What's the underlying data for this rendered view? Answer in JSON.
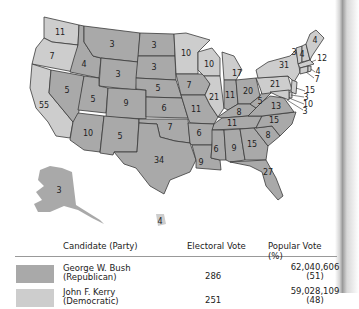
{
  "map": {
    "colors": {
      "republican": "#a9a9a9",
      "democrat": "#cdcdcd",
      "border": "#3a3a3a"
    },
    "states": [
      {
        "abbr": "WA",
        "ev": "11",
        "party": "democrat"
      },
      {
        "abbr": "OR",
        "ev": "7",
        "party": "democrat"
      },
      {
        "abbr": "CA",
        "ev": "55",
        "party": "democrat"
      },
      {
        "abbr": "ID",
        "ev": "4",
        "party": "republican"
      },
      {
        "abbr": "NV",
        "ev": "5",
        "party": "republican"
      },
      {
        "abbr": "MT",
        "ev": "3",
        "party": "republican"
      },
      {
        "abbr": "WY",
        "ev": "3",
        "party": "republican"
      },
      {
        "abbr": "UT",
        "ev": "5",
        "party": "republican"
      },
      {
        "abbr": "AZ",
        "ev": "10",
        "party": "republican"
      },
      {
        "abbr": "CO",
        "ev": "9",
        "party": "republican"
      },
      {
        "abbr": "NM",
        "ev": "5",
        "party": "republican"
      },
      {
        "abbr": "ND",
        "ev": "3",
        "party": "republican"
      },
      {
        "abbr": "SD",
        "ev": "3",
        "party": "republican"
      },
      {
        "abbr": "NE",
        "ev": "5",
        "party": "republican"
      },
      {
        "abbr": "KS",
        "ev": "6",
        "party": "republican"
      },
      {
        "abbr": "OK",
        "ev": "7",
        "party": "republican"
      },
      {
        "abbr": "TX",
        "ev": "34",
        "party": "republican"
      },
      {
        "abbr": "MN",
        "ev": "10",
        "party": "democrat"
      },
      {
        "abbr": "IA",
        "ev": "7",
        "party": "republican"
      },
      {
        "abbr": "MO",
        "ev": "11",
        "party": "republican"
      },
      {
        "abbr": "AR",
        "ev": "6",
        "party": "republican"
      },
      {
        "abbr": "LA",
        "ev": "9",
        "party": "republican"
      },
      {
        "abbr": "WI",
        "ev": "10",
        "party": "democrat"
      },
      {
        "abbr": "IL",
        "ev": "21",
        "party": "democrat"
      },
      {
        "abbr": "MI",
        "ev": "17",
        "party": "democrat"
      },
      {
        "abbr": "IN",
        "ev": "11",
        "party": "republican"
      },
      {
        "abbr": "OH",
        "ev": "20",
        "party": "republican"
      },
      {
        "abbr": "KY",
        "ev": "8",
        "party": "republican"
      },
      {
        "abbr": "TN",
        "ev": "11",
        "party": "republican"
      },
      {
        "abbr": "MS",
        "ev": "6",
        "party": "republican"
      },
      {
        "abbr": "AL",
        "ev": "9",
        "party": "republican"
      },
      {
        "abbr": "GA",
        "ev": "15",
        "party": "republican"
      },
      {
        "abbr": "FL",
        "ev": "27",
        "party": "republican"
      },
      {
        "abbr": "SC",
        "ev": "8",
        "party": "republican"
      },
      {
        "abbr": "NC",
        "ev": "15",
        "party": "republican"
      },
      {
        "abbr": "VA",
        "ev": "13",
        "party": "republican"
      },
      {
        "abbr": "WV",
        "ev": "5",
        "party": "republican"
      },
      {
        "abbr": "PA",
        "ev": "21",
        "party": "democrat"
      },
      {
        "abbr": "NY",
        "ev": "31",
        "party": "democrat"
      },
      {
        "abbr": "VT",
        "ev": "3",
        "party": "democrat"
      },
      {
        "abbr": "NH",
        "ev": "4",
        "party": "democrat"
      },
      {
        "abbr": "ME",
        "ev": "4",
        "party": "democrat"
      },
      {
        "abbr": "MA",
        "ev": "12",
        "party": "democrat"
      },
      {
        "abbr": "RI",
        "ev": "4",
        "party": "democrat"
      },
      {
        "abbr": "CT",
        "ev": "7",
        "party": "democrat"
      },
      {
        "abbr": "NJ",
        "ev": "15",
        "party": "democrat"
      },
      {
        "abbr": "DE",
        "ev": "3",
        "party": "democrat"
      },
      {
        "abbr": "MD",
        "ev": "10",
        "party": "democrat"
      },
      {
        "abbr": "DC",
        "ev": "3",
        "party": "democrat"
      },
      {
        "abbr": "AK",
        "ev": "3",
        "party": "republican"
      },
      {
        "abbr": "HI",
        "ev": "4",
        "party": "democrat"
      }
    ]
  },
  "table": {
    "headers": {
      "candidate": "Candidate (Party)",
      "electoral": "Electoral Vote",
      "popular": "Popular Vote (%)"
    },
    "rows": [
      {
        "name": "George W. Bush",
        "party": "(Republican)",
        "electoral": "286",
        "popular": "62,040,606",
        "percent": "(51)",
        "color": "#a9a9a9"
      },
      {
        "name": "John F. Kerry",
        "party": "(Democratic)",
        "electoral": "251",
        "popular": "59,028,109",
        "percent": "(48)",
        "color": "#cdcdcd"
      }
    ]
  }
}
